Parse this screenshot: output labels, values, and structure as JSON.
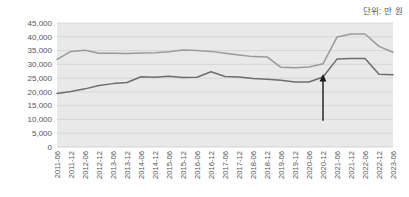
{
  "chart_data": {
    "type": "line",
    "title": "",
    "subtitle": "",
    "unit_label": "단위: 만 원",
    "xlabel": "",
    "ylabel": "",
    "ylim": [
      0,
      45000
    ],
    "ytick_step": 5000,
    "grid": true,
    "legend_position": "none",
    "x": [
      "2011-06",
      "2011-12",
      "2012-06",
      "2012-12",
      "2013-06",
      "2013-12",
      "2014-06",
      "2014-12",
      "2015-06",
      "2015-12",
      "2016-06",
      "2016-12",
      "2017-06",
      "2017-12",
      "2018-06",
      "2018-12",
      "2019-06",
      "2019-12",
      "2020-06",
      "2020-12",
      "2021-06",
      "2021-12",
      "2022-06",
      "2022-12",
      "2023-06"
    ],
    "categories": [
      "2011-06",
      "2011-12",
      "2012-06",
      "2012-12",
      "2013-06",
      "2013-12",
      "2014-06",
      "2014-12",
      "2015-06",
      "2015-12",
      "2016-06",
      "2016-12",
      "2017-06",
      "2017-12",
      "2018-06",
      "2018-12",
      "2019-06",
      "2019-12",
      "2020-06",
      "2020-12",
      "2021-06",
      "2021-12",
      "2022-06",
      "2022-12",
      "2023-06"
    ],
    "yticks": [
      "0",
      "5,000",
      "10,000",
      "15,000",
      "20,000",
      "25,000",
      "30,000",
      "35,000",
      "40,000",
      "45,000"
    ],
    "series": [
      {
        "name": "upper-line",
        "color": "#9a9a9a",
        "values": [
          31800,
          34700,
          35100,
          34000,
          34000,
          33900,
          34100,
          34200,
          34600,
          35200,
          35000,
          34700,
          34000,
          33400,
          32800,
          32700,
          28900,
          28800,
          29000,
          30200,
          39900,
          41000,
          41000,
          36500,
          34400
        ]
      },
      {
        "name": "lower-line",
        "color": "#6d6d6d",
        "values": [
          19400,
          20100,
          21100,
          22300,
          23000,
          23400,
          25500,
          25300,
          25700,
          25200,
          25300,
          27300,
          25600,
          25400,
          24900,
          24600,
          24200,
          23600,
          23600,
          25400,
          31900,
          32100,
          32100,
          26400,
          26200
        ]
      }
    ],
    "annotations": [
      {
        "name": "up-arrow",
        "type": "arrow",
        "direction": "up",
        "x_category": "2020-12",
        "y_start": 9500,
        "y_end": 26500,
        "color": "#1a1a1a",
        "label": ""
      }
    ],
    "colors": {
      "plot_background": "#e9e9e9",
      "gridline": "#cfcfcf",
      "axis_text": "#555555",
      "upper_line": "#9a9a9a",
      "lower_line": "#6d6d6d",
      "arrow": "#1a1a1a"
    }
  }
}
